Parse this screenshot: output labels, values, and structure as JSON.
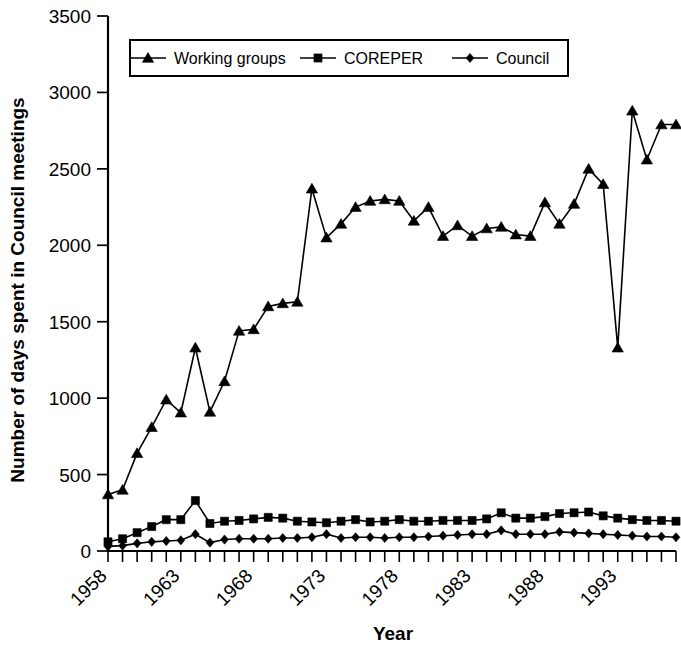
{
  "chart_data": {
    "type": "line",
    "title": "",
    "xlabel": "Year",
    "ylabel": "Number of days spent in Council meetings",
    "xlim": [
      1958,
      1997
    ],
    "ylim": [
      0,
      3500
    ],
    "ytick_values": [
      0,
      500,
      1000,
      1500,
      2000,
      2500,
      3000,
      3500
    ],
    "ytick_labels": [
      "0",
      "500",
      "1000",
      "1500",
      "2000",
      "2500",
      "3000",
      "3500"
    ],
    "xtick_labels": [
      "1958",
      "1963",
      "1968",
      "1973",
      "1978",
      "1983",
      "1988",
      "1993"
    ],
    "xtick_values": [
      1958,
      1963,
      1968,
      1973,
      1978,
      1983,
      1988,
      1993
    ],
    "x": [
      1958,
      1959,
      1960,
      1961,
      1962,
      1963,
      1964,
      1965,
      1966,
      1967,
      1968,
      1969,
      1970,
      1971,
      1972,
      1973,
      1974,
      1975,
      1976,
      1977,
      1978,
      1979,
      1980,
      1981,
      1982,
      1983,
      1984,
      1985,
      1986,
      1987,
      1988,
      1989,
      1990,
      1991,
      1992,
      1993,
      1994,
      1995,
      1996,
      1997
    ],
    "grid": false,
    "legend_position": "top-center",
    "series": [
      {
        "name": "Working groups",
        "marker": "triangle",
        "values": [
          370,
          400,
          640,
          810,
          990,
          905,
          1330,
          910,
          1110,
          1440,
          1450,
          1600,
          1620,
          1630,
          2370,
          2050,
          2140,
          2250,
          2290,
          2300,
          2290,
          2160,
          2250,
          2060,
          2130,
          2060,
          2110,
          2120,
          2070,
          2060,
          2280,
          2140,
          2270,
          2500,
          2400,
          1330,
          2880,
          2560,
          2790,
          2790
        ]
      },
      {
        "name": "COREPER",
        "marker": "square",
        "values": [
          60,
          80,
          120,
          160,
          205,
          205,
          330,
          180,
          195,
          200,
          210,
          220,
          215,
          195,
          190,
          185,
          195,
          205,
          190,
          195,
          205,
          195,
          195,
          200,
          200,
          200,
          210,
          250,
          215,
          215,
          225,
          245,
          250,
          255,
          230,
          215,
          205,
          200,
          200,
          195
        ]
      },
      {
        "name": "Council",
        "marker": "diamond",
        "values": [
          30,
          35,
          50,
          60,
          65,
          70,
          110,
          55,
          75,
          80,
          80,
          80,
          85,
          85,
          90,
          110,
          85,
          90,
          90,
          85,
          90,
          90,
          95,
          100,
          105,
          110,
          110,
          135,
          110,
          110,
          110,
          125,
          120,
          115,
          110,
          105,
          100,
          95,
          95,
          90
        ]
      }
    ]
  },
  "legend": {
    "items": [
      {
        "label": "Working groups",
        "marker": "triangle"
      },
      {
        "label": "COREPER",
        "marker": "square"
      },
      {
        "label": "Council",
        "marker": "diamond"
      }
    ]
  }
}
